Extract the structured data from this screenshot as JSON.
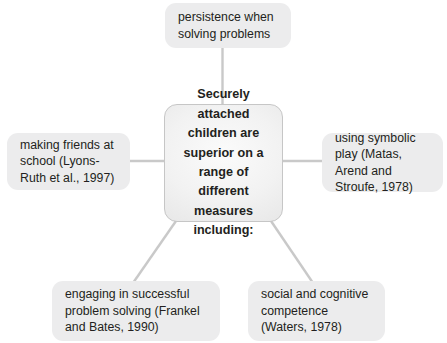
{
  "diagram": {
    "type": "mind-map",
    "title_node": {
      "id": "central",
      "text": "Securely attached children are superior on a range of different measures including:"
    },
    "branches": [
      {
        "id": "top",
        "position": "top",
        "text": "persistence when solving problems"
      },
      {
        "id": "left",
        "position": "left",
        "text": "making friends at school (Lyons-Ruth et al., 1997)"
      },
      {
        "id": "right",
        "position": "right",
        "text": "using symbolic play (Matas, Arend and Stroufe, 1978)"
      },
      {
        "id": "bottom-left",
        "position": "bottom-left",
        "text": "engaging in successful problem solving (Frankel and Bates, 1990)"
      },
      {
        "id": "bottom-right",
        "position": "bottom-right",
        "text": "social and cognitive competence (Waters, 1978)"
      }
    ],
    "colors": {
      "page_background": "#ffffff",
      "node_fill": "#ececed",
      "central_fill": "#f2f2f2",
      "central_border": "#c6c6c6",
      "connector": "#c9c9c9",
      "text": "#231f20"
    }
  }
}
